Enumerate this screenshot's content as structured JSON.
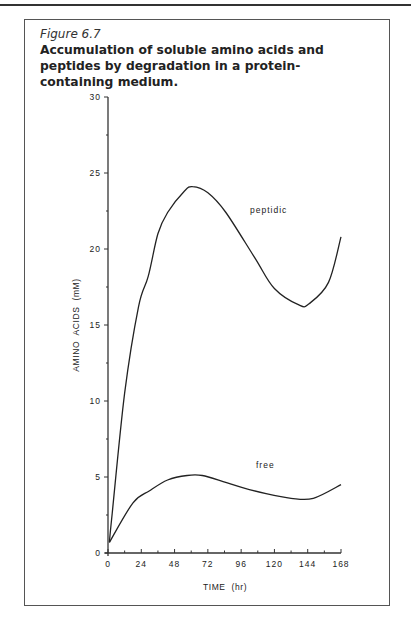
{
  "figure": {
    "label": "Figure 6.7",
    "title": "Accumulation of soluble amino acids and peptides by degradation in a protein-containing medium."
  },
  "chart_data": {
    "type": "line",
    "title": "Accumulation of soluble amino acids and peptides by degradation in a protein-containing medium.",
    "xlabel": "TIME  (hr)",
    "ylabel": "AMINO  ACIDS  (mM)",
    "xlim": [
      0,
      168
    ],
    "ylim": [
      0,
      30
    ],
    "x_ticks": [
      "0",
      "24",
      "48",
      "72",
      "96",
      "120",
      "144",
      "168"
    ],
    "y_ticks": [
      "0",
      "5",
      "10",
      "15",
      "20",
      "25",
      "30"
    ],
    "grid": false,
    "legend": "inline labels",
    "series": [
      {
        "name": "peptidic",
        "x": [
          1,
          3,
          12,
          22,
          29,
          36,
          43,
          55,
          61,
          72,
          85,
          106,
          120,
          138,
          145,
          159,
          168
        ],
        "values": [
          0.7,
          2.6,
          10.5,
          16.2,
          18.2,
          21.0,
          22.4,
          23.8,
          24.1,
          23.7,
          22.4,
          19.4,
          17.4,
          16.3,
          16.4,
          17.8,
          20.8
        ]
      },
      {
        "name": "free",
        "x": [
          1,
          18,
          30,
          43,
          57,
          68,
          83,
          97,
          114,
          132,
          148,
          168
        ],
        "values": [
          0.7,
          3.3,
          4.1,
          4.8,
          5.1,
          5.1,
          4.7,
          4.3,
          3.9,
          3.6,
          3.6,
          4.5
        ]
      }
    ]
  }
}
